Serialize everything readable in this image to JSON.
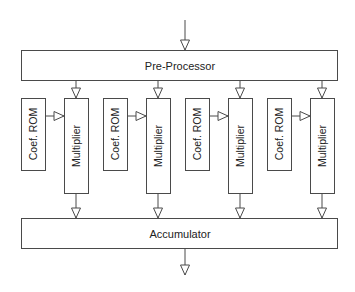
{
  "diagram": {
    "title": "",
    "nodes": {
      "preprocessor": {
        "label": "Pre-Processor"
      },
      "accumulator": {
        "label": "Accumulator"
      },
      "stages": [
        {
          "rom_label": "Coef. ROM",
          "mult_label": "Multiplier"
        },
        {
          "rom_label": "Coef. ROM",
          "mult_label": "Multiplier"
        },
        {
          "rom_label": "Coef. ROM",
          "mult_label": "Multiplier"
        },
        {
          "rom_label": "Coef. ROM",
          "mult_label": "Multiplier"
        }
      ]
    },
    "edges": [
      {
        "from": "input",
        "to": "preprocessor"
      },
      {
        "from": "preprocessor",
        "to": "multiplier-1"
      },
      {
        "from": "preprocessor",
        "to": "multiplier-2"
      },
      {
        "from": "preprocessor",
        "to": "multiplier-3"
      },
      {
        "from": "preprocessor",
        "to": "multiplier-4"
      },
      {
        "from": "coef-rom-1",
        "to": "multiplier-1"
      },
      {
        "from": "coef-rom-2",
        "to": "multiplier-2"
      },
      {
        "from": "coef-rom-3",
        "to": "multiplier-3"
      },
      {
        "from": "coef-rom-4",
        "to": "multiplier-4"
      },
      {
        "from": "multiplier-1",
        "to": "accumulator"
      },
      {
        "from": "multiplier-2",
        "to": "accumulator"
      },
      {
        "from": "multiplier-3",
        "to": "accumulator"
      },
      {
        "from": "multiplier-4",
        "to": "accumulator"
      },
      {
        "from": "accumulator",
        "to": "output"
      }
    ]
  }
}
